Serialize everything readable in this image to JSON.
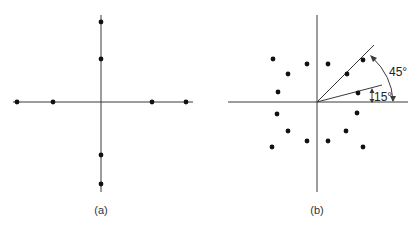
{
  "panels": [
    {
      "id": "a",
      "label": "(a)",
      "origin": [
        101,
        102
      ],
      "x_axis": [
        13,
        193
      ],
      "y_axis": [
        15,
        192
      ],
      "points": [
        [
          17,
          102
        ],
        [
          53,
          102
        ],
        [
          152,
          102
        ],
        [
          186,
          102
        ],
        [
          101,
          22
        ],
        [
          101,
          59
        ],
        [
          101,
          155
        ],
        [
          101,
          184
        ]
      ]
    },
    {
      "id": "b",
      "label": "(b)",
      "origin": [
        317,
        102
      ],
      "x_axis": [
        228,
        408
      ],
      "y_axis": [
        15,
        192
      ],
      "points": [
        [
          273,
          59
        ],
        [
          307,
          64
        ],
        [
          288,
          74
        ],
        [
          278,
          92
        ],
        [
          328,
          64
        ],
        [
          363,
          60
        ],
        [
          347,
          74
        ],
        [
          358,
          93
        ],
        [
          277,
          114
        ],
        [
          288,
          131
        ],
        [
          307,
          141
        ],
        [
          272,
          147
        ],
        [
          357,
          113
        ],
        [
          346,
          131
        ],
        [
          328,
          141
        ],
        [
          363,
          147
        ]
      ],
      "angle_labels": [
        {
          "text": "45°",
          "x": 388,
          "y": 76
        },
        {
          "text": "15°",
          "x": 373,
          "y": 101
        }
      ]
    }
  ],
  "colors": {
    "axis": "#3a3a3a",
    "dot": "#111111",
    "background": "#ffffff"
  }
}
